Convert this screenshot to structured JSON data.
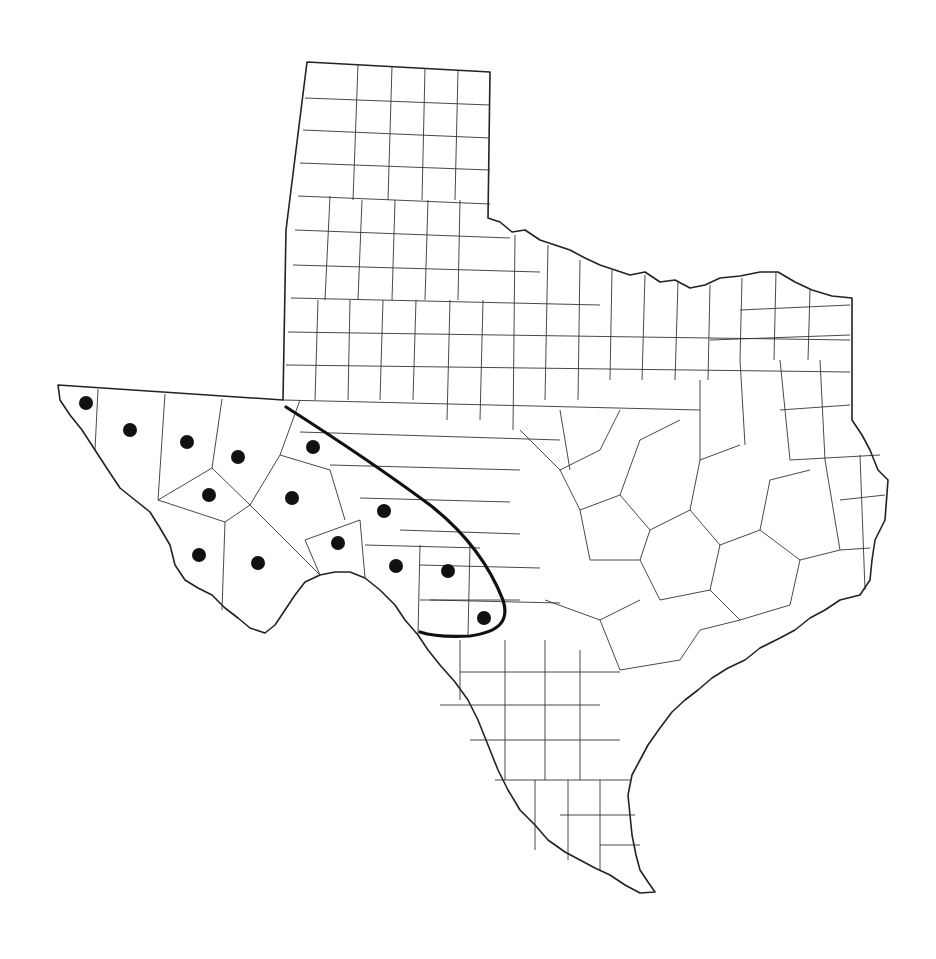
{
  "map": {
    "region": "Texas",
    "subdivisions": "counties",
    "background": "#ffffff",
    "line_color": "#222222",
    "marker_color": "#111111",
    "range_line_color": "#111111"
  },
  "markers": [
    {
      "x": 86,
      "y": 403
    },
    {
      "x": 130,
      "y": 430
    },
    {
      "x": 187,
      "y": 442
    },
    {
      "x": 238,
      "y": 457
    },
    {
      "x": 313,
      "y": 447
    },
    {
      "x": 209,
      "y": 495
    },
    {
      "x": 292,
      "y": 498
    },
    {
      "x": 384,
      "y": 511
    },
    {
      "x": 338,
      "y": 543
    },
    {
      "x": 199,
      "y": 555
    },
    {
      "x": 258,
      "y": 563
    },
    {
      "x": 396,
      "y": 566
    },
    {
      "x": 448,
      "y": 571
    },
    {
      "x": 484,
      "y": 618
    }
  ],
  "range_boundary": {
    "description": "Bold curve enclosing eastern edge of occurrence region",
    "points": [
      [
        286,
        407
      ],
      [
        330,
        435
      ],
      [
        380,
        470
      ],
      [
        430,
        505
      ],
      [
        465,
        535
      ],
      [
        490,
        570
      ],
      [
        505,
        605
      ],
      [
        503,
        620
      ],
      [
        490,
        632
      ],
      [
        455,
        636
      ],
      [
        420,
        632
      ]
    ]
  }
}
